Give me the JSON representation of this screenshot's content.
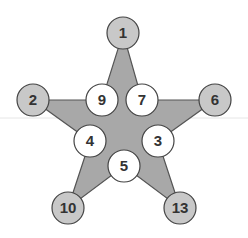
{
  "diagram": {
    "type": "magic-star",
    "colors": {
      "star_fill": "#a8a8a8",
      "star_stroke": "#555555",
      "outer_node_fill": "#c8c8c8",
      "inner_node_fill": "#ffffff",
      "node_stroke": "#444444",
      "separator": "#e6e6e6"
    },
    "star_points": "123,33 142,100 215,100 158,141 180,208 124,166 68,208 90,141 33,100 102,100",
    "outer_nodes": [
      {
        "id": "top",
        "label": "1",
        "cx": 123,
        "cy": 33
      },
      {
        "id": "left",
        "label": "2",
        "cx": 33,
        "cy": 100
      },
      {
        "id": "right",
        "label": "6",
        "cx": 215,
        "cy": 100
      },
      {
        "id": "bottom-left",
        "label": "10",
        "cx": 68,
        "cy": 208
      },
      {
        "id": "bottom-right",
        "label": "13",
        "cx": 180,
        "cy": 208
      }
    ],
    "inner_nodes": [
      {
        "id": "upper-left",
        "label": "9",
        "cx": 102,
        "cy": 100
      },
      {
        "id": "upper-right",
        "label": "7",
        "cx": 142,
        "cy": 100
      },
      {
        "id": "mid-left",
        "label": "4",
        "cx": 90,
        "cy": 141
      },
      {
        "id": "mid-right",
        "label": "3",
        "cx": 158,
        "cy": 141
      },
      {
        "id": "bottom",
        "label": "5",
        "cx": 124,
        "cy": 166
      }
    ]
  }
}
